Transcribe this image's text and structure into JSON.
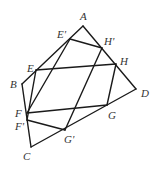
{
  "diagram": {
    "type": "geometry",
    "stroke_color": "#1a1a1a",
    "label_color": "#333333",
    "points": {
      "A": {
        "x": 83,
        "y": 26,
        "label": "A",
        "lx": 80,
        "ly": 20
      },
      "B": {
        "x": 22,
        "y": 84,
        "label": "B",
        "lx": 10,
        "ly": 88
      },
      "C": {
        "x": 31,
        "y": 147,
        "label": "C",
        "lx": 23,
        "ly": 160
      },
      "D": {
        "x": 136,
        "y": 89,
        "label": "D",
        "lx": 141,
        "ly": 97
      },
      "E": {
        "x": 36,
        "y": 70,
        "label": "E",
        "lx": 27,
        "ly": 72
      },
      "E'": {
        "x": 70,
        "y": 39,
        "label": "E'",
        "lx": 57,
        "ly": 38
      },
      "F": {
        "x": 27,
        "y": 113,
        "label": "F",
        "lx": 15,
        "ly": 117
      },
      "F'": {
        "x": 27,
        "y": 120,
        "label": "F'",
        "lx": 15,
        "ly": 130
      },
      "G": {
        "x": 107,
        "y": 105,
        "label": "G",
        "lx": 108,
        "ly": 119
      },
      "G'": {
        "x": 65,
        "y": 130,
        "label": "G'",
        "lx": 64,
        "ly": 143
      },
      "H": {
        "x": 116,
        "y": 64,
        "label": "H",
        "lx": 120,
        "ly": 65
      },
      "H'": {
        "x": 102,
        "y": 48,
        "label": "H'",
        "lx": 104,
        "ly": 45
      }
    },
    "edges": [
      [
        "A",
        "B"
      ],
      [
        "B",
        "C"
      ],
      [
        "C",
        "D"
      ],
      [
        "D",
        "A"
      ],
      [
        "E",
        "H"
      ],
      [
        "H",
        "G"
      ],
      [
        "G",
        "F"
      ],
      [
        "F",
        "E'"
      ],
      [
        "E'",
        "H'"
      ],
      [
        "H'",
        "G'"
      ],
      [
        "G'",
        "F'"
      ],
      [
        "F'",
        "E"
      ]
    ]
  }
}
